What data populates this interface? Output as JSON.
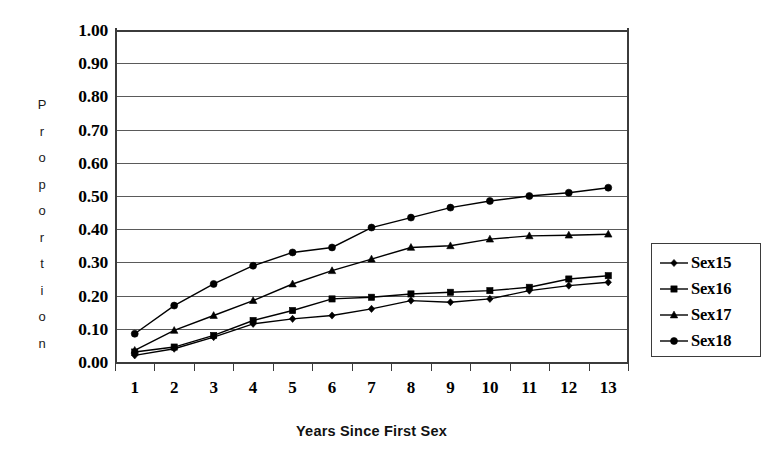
{
  "chart_data": {
    "type": "line",
    "title": "",
    "xlabel": "Years Since First Sex",
    "ylabel": "Proportion",
    "ylabel_letters": [
      "P",
      "r",
      "o",
      "p",
      "o",
      "r",
      "t",
      "i",
      "o",
      "n"
    ],
    "categories": [
      1,
      2,
      3,
      4,
      5,
      6,
      7,
      8,
      9,
      10,
      11,
      12,
      13
    ],
    "xtick_labels": [
      "1",
      "2",
      "3",
      "4",
      "5",
      "6",
      "7",
      "8",
      "9",
      "10",
      "11",
      "12",
      "13"
    ],
    "ytick_labels": [
      "1.00",
      "0.90",
      "0.80",
      "0.70",
      "0.60",
      "0.50",
      "0.40",
      "0.30",
      "0.20",
      "0.10",
      "0.00"
    ],
    "ytick_values": [
      1.0,
      0.9,
      0.8,
      0.7,
      0.6,
      0.5,
      0.4,
      0.3,
      0.2,
      0.1,
      0.0
    ],
    "ylim": [
      0.0,
      1.0
    ],
    "xlim": [
      1,
      13
    ],
    "grid": true,
    "grid_axis": "y",
    "legend_position": "right",
    "series": [
      {
        "name": "Sex15",
        "marker": "diamond",
        "color": "#000000",
        "values": [
          0.02,
          0.04,
          0.075,
          0.115,
          0.13,
          0.14,
          0.16,
          0.185,
          0.18,
          0.19,
          0.215,
          0.23,
          0.24
        ]
      },
      {
        "name": "Sex16",
        "marker": "square",
        "color": "#000000",
        "values": [
          0.03,
          0.045,
          0.08,
          0.125,
          0.155,
          0.19,
          0.195,
          0.205,
          0.21,
          0.215,
          0.225,
          0.25,
          0.26
        ]
      },
      {
        "name": "Sex17",
        "marker": "triangle",
        "color": "#000000",
        "values": [
          0.035,
          0.095,
          0.14,
          0.185,
          0.235,
          0.275,
          0.31,
          0.345,
          0.35,
          0.37,
          0.38,
          0.382,
          0.385
        ]
      },
      {
        "name": "Sex18",
        "marker": "circle",
        "color": "#000000",
        "values": [
          0.085,
          0.17,
          0.235,
          0.29,
          0.33,
          0.345,
          0.405,
          0.435,
          0.465,
          0.485,
          0.5,
          0.51,
          0.525
        ]
      }
    ]
  },
  "legend": {
    "items": [
      {
        "label": "Sex15",
        "marker": "diamond"
      },
      {
        "label": "Sex16",
        "marker": "square"
      },
      {
        "label": "Sex17",
        "marker": "triangle"
      },
      {
        "label": "Sex18",
        "marker": "circle"
      }
    ]
  }
}
